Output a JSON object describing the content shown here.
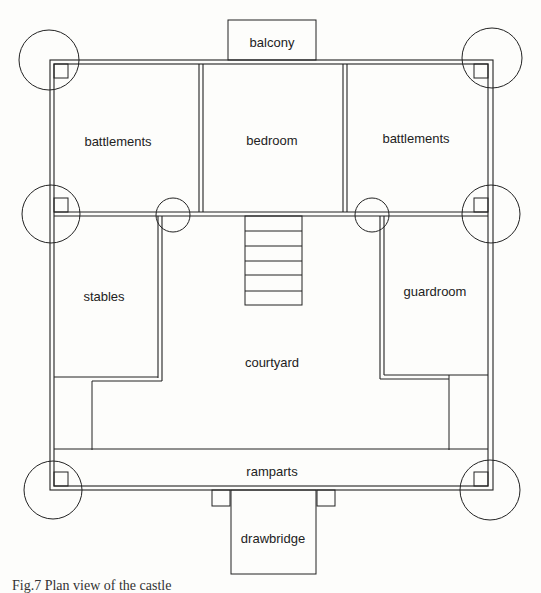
{
  "figure": {
    "caption": "Fig.7 Plan view of the castle"
  },
  "rooms": {
    "balcony": "balcony",
    "battlements_left": "battlements",
    "bedroom": "bedroom",
    "battlements_right": "battlements",
    "stables": "stables",
    "courtyard": "courtyard",
    "guardroom": "guardroom",
    "ramparts": "ramparts",
    "drawbridge": "drawbridge"
  },
  "structure": {
    "towers": 8,
    "stair_steps": 6,
    "line_color": "#222222",
    "background": "#fdfdfb"
  }
}
